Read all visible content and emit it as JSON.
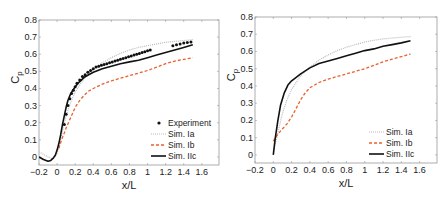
{
  "chart_data": [
    {
      "type": "line",
      "title": "",
      "xlabel": "x/L",
      "ylabel": "Cp",
      "xlim": [
        -0.2,
        1.79
      ],
      "ylim": [
        -0.047,
        0.8
      ],
      "xticks": [
        "-0.2",
        "0",
        "0.2",
        "0.4",
        "0.6",
        "0.8",
        "1",
        "1.2",
        "1.4",
        "1.6"
      ],
      "xtick_values": [
        -0.2,
        0,
        0.2,
        0.4,
        0.6,
        0.8,
        1,
        1.2,
        1.4,
        1.6
      ],
      "yticks": [
        "0",
        "0.1",
        "0.2",
        "0.3",
        "0.4",
        "0.5",
        "0.6",
        "0.7",
        "0.8"
      ],
      "ytick_values": [
        0,
        0.1,
        0.2,
        0.3,
        0.4,
        0.5,
        0.6,
        0.7,
        0.8
      ],
      "grid": false,
      "legend_position": "lower right",
      "series": [
        {
          "name": "Experiment",
          "style": "markers",
          "color": "#111111",
          "x": [
            0.08,
            0.1,
            0.12,
            0.14,
            0.16,
            0.18,
            0.2,
            0.22,
            0.25,
            0.28,
            0.31,
            0.34,
            0.37,
            0.4,
            0.43,
            0.46,
            0.49,
            0.52,
            0.55,
            0.58,
            0.61,
            0.64,
            0.67,
            0.7,
            0.73,
            0.76,
            0.79,
            0.82,
            0.85,
            0.88,
            0.91,
            0.94,
            0.97,
            1.0,
            1.03,
            1.28,
            1.32,
            1.36,
            1.4,
            1.44,
            1.48
          ],
          "y": [
            0.19,
            0.25,
            0.3,
            0.34,
            0.37,
            0.39,
            0.41,
            0.43,
            0.45,
            0.47,
            0.48,
            0.495,
            0.505,
            0.515,
            0.525,
            0.53,
            0.535,
            0.54,
            0.545,
            0.55,
            0.555,
            0.56,
            0.565,
            0.57,
            0.575,
            0.58,
            0.585,
            0.59,
            0.595,
            0.6,
            0.605,
            0.61,
            0.615,
            0.62,
            0.625,
            0.65,
            0.655,
            0.66,
            0.665,
            0.668,
            0.672
          ]
        },
        {
          "name": "Sim. Ia",
          "style": "dotted",
          "color": "#bbbbbb",
          "x": [
            -0.2,
            -0.15,
            -0.1,
            -0.05,
            0.0,
            0.03,
            0.06,
            0.1,
            0.15,
            0.2,
            0.25,
            0.3,
            0.4,
            0.5,
            0.6,
            0.7,
            0.8,
            0.9,
            1.0,
            1.1,
            1.2,
            1.3,
            1.4,
            1.5
          ],
          "y": [
            0.03,
            0.015,
            0.0,
            -0.01,
            0.02,
            0.08,
            0.15,
            0.24,
            0.32,
            0.38,
            0.42,
            0.46,
            0.51,
            0.55,
            0.58,
            0.605,
            0.625,
            0.64,
            0.65,
            0.66,
            0.67,
            0.675,
            0.68,
            0.685
          ]
        },
        {
          "name": "Sim. Ib",
          "style": "dashed",
          "color": "#e8602c",
          "x": [
            0.02,
            0.05,
            0.08,
            0.1,
            0.15,
            0.2,
            0.25,
            0.3,
            0.35,
            0.4,
            0.5,
            0.6,
            0.7,
            0.8,
            0.9,
            1.0,
            1.1,
            1.2,
            1.3,
            1.4,
            1.5
          ],
          "y": [
            0.05,
            0.1,
            0.14,
            0.17,
            0.23,
            0.29,
            0.33,
            0.36,
            0.385,
            0.4,
            0.425,
            0.445,
            0.46,
            0.475,
            0.49,
            0.505,
            0.525,
            0.545,
            0.56,
            0.57,
            0.58
          ]
        },
        {
          "name": "Sim. IIc",
          "style": "solid",
          "color": "#111111",
          "x": [
            -0.2,
            -0.15,
            -0.1,
            -0.07,
            -0.04,
            -0.02,
            0.0,
            0.02,
            0.04,
            0.06,
            0.08,
            0.1,
            0.12,
            0.15,
            0.2,
            0.25,
            0.3,
            0.35,
            0.4,
            0.5,
            0.6,
            0.7,
            0.8,
            0.9,
            1.0,
            1.1,
            1.2,
            1.3,
            1.4,
            1.5
          ],
          "y": [
            0.0,
            -0.015,
            -0.025,
            -0.02,
            -0.005,
            0.01,
            0.04,
            0.08,
            0.13,
            0.19,
            0.24,
            0.29,
            0.33,
            0.37,
            0.41,
            0.44,
            0.465,
            0.48,
            0.495,
            0.515,
            0.53,
            0.545,
            0.555,
            0.565,
            0.58,
            0.595,
            0.61,
            0.625,
            0.64,
            0.655
          ]
        }
      ]
    },
    {
      "type": "line",
      "title": "",
      "xlabel": "x/L",
      "ylabel": "Cp",
      "xlim": [
        -0.2,
        1.79
      ],
      "ylim": [
        -0.047,
        0.8
      ],
      "xticks": [
        "-0.2",
        "0",
        "0.2",
        "0.4",
        "0.6",
        "0.8",
        "1",
        "1.2",
        "1.4",
        "1.6"
      ],
      "xtick_values": [
        -0.2,
        0,
        0.2,
        0.4,
        0.6,
        0.8,
        1,
        1.2,
        1.4,
        1.6
      ],
      "yticks": [
        "0",
        "0.1",
        "0.2",
        "0.3",
        "0.4",
        "0.5",
        "0.6",
        "0.7",
        "0.8"
      ],
      "ytick_values": [
        0,
        0.1,
        0.2,
        0.3,
        0.4,
        0.5,
        0.6,
        0.7,
        0.8
      ],
      "grid": false,
      "legend_position": "lower right",
      "series": [
        {
          "name": "Sim. Ia",
          "style": "dotted",
          "color": "#bbbbbb",
          "x": [
            0.0,
            0.03,
            0.06,
            0.1,
            0.15,
            0.2,
            0.25,
            0.3,
            0.4,
            0.5,
            0.6,
            0.7,
            0.8,
            0.9,
            1.0,
            1.1,
            1.2,
            1.3,
            1.4,
            1.5
          ],
          "y": [
            0.02,
            0.08,
            0.15,
            0.24,
            0.32,
            0.38,
            0.42,
            0.46,
            0.51,
            0.55,
            0.58,
            0.605,
            0.625,
            0.64,
            0.655,
            0.665,
            0.673,
            0.678,
            0.683,
            0.686
          ]
        },
        {
          "name": "Sim. Ib",
          "style": "dashed",
          "color": "#e8602c",
          "x": [
            0.0,
            0.05,
            0.1,
            0.15,
            0.2,
            0.25,
            0.3,
            0.35,
            0.4,
            0.5,
            0.6,
            0.7,
            0.8,
            0.9,
            1.0,
            1.1,
            1.2,
            1.3,
            1.4,
            1.5
          ],
          "y": [
            0.08,
            0.12,
            0.15,
            0.18,
            0.22,
            0.27,
            0.32,
            0.36,
            0.39,
            0.42,
            0.44,
            0.455,
            0.47,
            0.485,
            0.5,
            0.52,
            0.54,
            0.555,
            0.57,
            0.585
          ]
        },
        {
          "name": "Sim. IIc",
          "style": "solid",
          "color": "#111111",
          "x": [
            0.0,
            0.02,
            0.05,
            0.08,
            0.12,
            0.16,
            0.2,
            0.25,
            0.3,
            0.4,
            0.5,
            0.6,
            0.7,
            0.8,
            0.9,
            1.0,
            1.1,
            1.2,
            1.3,
            1.4,
            1.5
          ],
          "y": [
            0.0,
            0.09,
            0.2,
            0.29,
            0.36,
            0.405,
            0.43,
            0.45,
            0.47,
            0.505,
            0.53,
            0.545,
            0.56,
            0.575,
            0.59,
            0.605,
            0.615,
            0.63,
            0.64,
            0.65,
            0.662
          ]
        }
      ]
    }
  ],
  "panels": [
    {
      "xlabel": "x/L",
      "ylabel_main": "C",
      "ylabel_sub": "p",
      "legend": [
        "Experiment",
        "Sim. Ia",
        "Sim. Ib",
        "Sim. IIc"
      ]
    },
    {
      "xlabel": "x/L",
      "ylabel_main": "C",
      "ylabel_sub": "p",
      "legend": [
        "Sim. Ia",
        "Sim. Ib",
        "Sim. IIc"
      ]
    }
  ]
}
